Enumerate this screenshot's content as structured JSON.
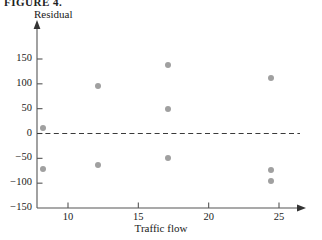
{
  "figure": {
    "cut_off_header": "FIGURE 4.",
    "point_color": "#a0a0a0",
    "axis_color": "#555555",
    "reference_line_value": 0
  },
  "chart_data": {
    "type": "scatter",
    "title": "",
    "xlabel": "Traffic flow",
    "ylabel": "Residual",
    "xlim": [
      7,
      27
    ],
    "ylim": [
      -150,
      175
    ],
    "grid": false,
    "legend": null,
    "xticks": [
      10,
      15,
      20,
      25
    ],
    "xtick_labels": [
      "10",
      "15",
      "20",
      "25"
    ],
    "yticks": [
      150,
      100,
      50,
      0,
      -50,
      -100,
      -150
    ],
    "ytick_labels": [
      "150",
      "100",
      "50",
      "0",
      "−50",
      "−100",
      "−150"
    ],
    "reference_line": {
      "y": 0,
      "style": "dashed"
    },
    "points": [
      {
        "x": 8.2,
        "y": 12
      },
      {
        "x": 8.2,
        "y": -72
      },
      {
        "x": 12.1,
        "y": 96
      },
      {
        "x": 12.1,
        "y": -63
      },
      {
        "x": 17.1,
        "y": 138
      },
      {
        "x": 17.1,
        "y": 50
      },
      {
        "x": 17.1,
        "y": -50
      },
      {
        "x": 24.4,
        "y": 112
      },
      {
        "x": 24.4,
        "y": -73
      },
      {
        "x": 24.4,
        "y": -95
      }
    ]
  }
}
